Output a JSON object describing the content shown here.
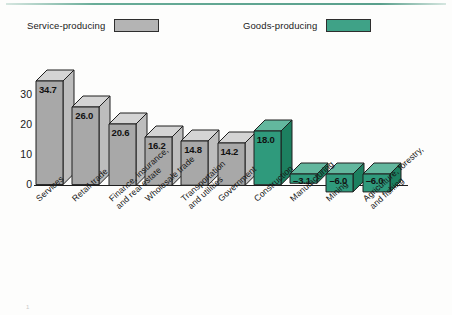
{
  "legend": {
    "service": {
      "label": "Service-producing",
      "color": "#b4b4b4",
      "swatch_name": "gray-swatch"
    },
    "goods": {
      "label": "Goods-producing",
      "color": "#3fa287",
      "swatch_name": "green-swatch"
    }
  },
  "footnote": {
    "marker": "1",
    "text": ""
  },
  "chart_data": {
    "type": "bar",
    "title": "",
    "subtitle": "",
    "xlabel": "",
    "ylabel": "",
    "ylim": [
      -10,
      38
    ],
    "yticks": [
      0,
      10,
      20,
      30
    ],
    "ytick_labels": [
      "0",
      "10",
      "20",
      "30"
    ],
    "grid": false,
    "legend_position": "top",
    "style": "3d-bar",
    "categories": [
      "Services",
      "Retail trade",
      "Finance, insurance,\nand real estate",
      "Wholesale trade",
      "Transportation\nand utilities",
      "Government",
      "Construction",
      "Manufacturing",
      "Mining",
      "Agriculture, forestry,\nand fishing"
    ],
    "values": [
      34.7,
      26.0,
      20.6,
      16.2,
      14.8,
      14.2,
      18.0,
      -3.1,
      -6.0,
      -6.0
    ],
    "value_labels": [
      "34.7",
      "26.0",
      "20.6",
      "16.2",
      "14.8",
      "14.2",
      "18.0",
      "–3.1",
      "–6.0",
      "–6.0"
    ],
    "groups": [
      "Service-producing",
      "Service-producing",
      "Service-producing",
      "Service-producing",
      "Service-producing",
      "Service-producing",
      "Goods-producing",
      "Goods-producing",
      "Goods-producing",
      "Goods-producing"
    ],
    "colors": {
      "gray_front": "#a8a8a8",
      "gray_top": "#d4d4d4",
      "gray_side": "#bdbdbd",
      "green_front": "#2f9a7c",
      "green_top": "#63b79e",
      "green_side": "#1d8060",
      "outline": "#1e1e1e"
    }
  }
}
